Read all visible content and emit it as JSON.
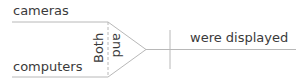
{
  "diagram": {
    "type": "sentence-diagram",
    "subject": {
      "top_word": "cameras",
      "bottom_word": "computers",
      "conjunction_left": "Both",
      "conjunction_right": "and"
    },
    "predicate": "were displayed",
    "colors": {
      "line": "#b8b8b8",
      "text": "#3a3a3a",
      "background": "#ffffff"
    }
  }
}
